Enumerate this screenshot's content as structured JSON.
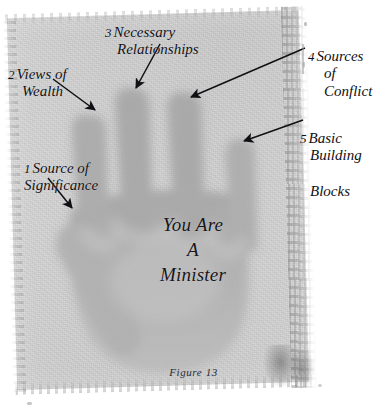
{
  "figure": {
    "caption": "Figure 13",
    "palm_text_lines": [
      "You Are",
      "A",
      "Minister"
    ]
  },
  "callouts": [
    {
      "id": "source-of-significance",
      "number": "1",
      "line1": "Source of",
      "line2": "Significance",
      "points_to": "thumb",
      "arrow": {
        "x1": 48,
        "y1": 178,
        "x2": 72,
        "y2": 208
      }
    },
    {
      "id": "views-of-wealth",
      "number": "2",
      "line1": "Views of",
      "line2": "Wealth",
      "points_to": "index-finger",
      "arrow": {
        "x1": 53,
        "y1": 79,
        "x2": 95,
        "y2": 110
      }
    },
    {
      "id": "necessary-relationships",
      "number": "3",
      "line1": "Necessary",
      "line2": "Relationships",
      "points_to": "middle-finger",
      "arrow": {
        "x1": 160,
        "y1": 44,
        "x2": 136,
        "y2": 88
      }
    },
    {
      "id": "sources-of-conflict",
      "number": "4",
      "line1": "Sources",
      "line2": "of Conflict",
      "points_to": "ring-finger",
      "arrow": {
        "x1": 305,
        "y1": 48,
        "x2": 191,
        "y2": 97
      }
    },
    {
      "id": "basic-building-blocks",
      "number": "5",
      "line1": "Basic",
      "line2": "Building",
      "line3": "Blocks",
      "points_to": "little-finger",
      "arrow": {
        "x1": 303,
        "y1": 120,
        "x2": 244,
        "y2": 141
      }
    }
  ],
  "colors": {
    "page_background": "#ffffff",
    "plate_light": "#d9d9d9",
    "plate_mid": "#cfcfcf",
    "hand_gray": "#b6b6b6",
    "finger_gray": "#a9a9a9",
    "ink_black": "#101014"
  }
}
